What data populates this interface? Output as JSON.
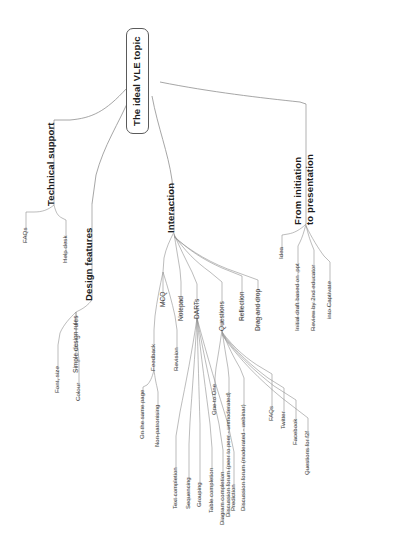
{
  "diagram": {
    "type": "mind-map",
    "orientation": "rotated-90-ccw",
    "background_color": "#ffffff",
    "line_color": "#8a8a8a",
    "text_color": "#2b2b2b",
    "central": {
      "label": "The ideal VLE topic"
    },
    "branches": [
      {
        "label": "Technical support",
        "children": [
          {
            "label": "FAQs",
            "children": []
          },
          {
            "label": "Help desk",
            "children": []
          }
        ]
      },
      {
        "label": "Design features",
        "children": [
          {
            "label": "Simple design rules",
            "children": [
              {
                "label": "Font, size"
              },
              {
                "label": "Colour"
              }
            ]
          }
        ]
      },
      {
        "label": "Interaction",
        "children": [
          {
            "label": "MCQ",
            "children": [
              {
                "label": "Feedback",
                "children": [
                  {
                    "label": "On the same page"
                  },
                  {
                    "label": "Non-patronising"
                  }
                ]
              },
              {
                "label": "Revision",
                "children": []
              }
            ]
          },
          {
            "label": "Notepad",
            "children": []
          },
          {
            "label": "DARTs",
            "children": [
              {
                "label": "Text completion"
              },
              {
                "label": "Sequencing"
              },
              {
                "label": "Grouping"
              },
              {
                "label": "Table completion"
              },
              {
                "label": "Diagram completion"
              },
              {
                "label": "Prediction"
              }
            ]
          },
          {
            "label": "Questions",
            "children": [
              {
                "label": "One to One"
              },
              {
                "label": "Discussion forum (peer to peer - unmoderated)"
              },
              {
                "label": "Discussion forum (moderated - webinar)"
              },
              {
                "label": "FAQs"
              },
              {
                "label": "Twitter"
              },
              {
                "label": "Facebook"
              },
              {
                "label": "Questions for f2f"
              }
            ]
          },
          {
            "label": "Reflection",
            "children": []
          },
          {
            "label": "Drag and drop",
            "children": []
          }
        ]
      },
      {
        "label": "From initiation\nto presentation",
        "children": [
          {
            "label": "Idea"
          },
          {
            "label": "Initial draft based on .ppt"
          },
          {
            "label": "Review by 2nd educator"
          },
          {
            "label": "into Captivate"
          }
        ]
      }
    ]
  }
}
